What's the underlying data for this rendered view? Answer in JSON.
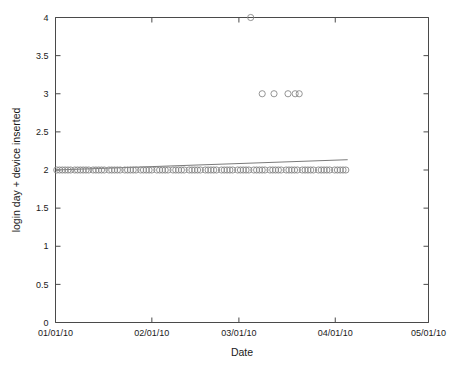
{
  "chart_data": {
    "type": "scatter",
    "title": "",
    "xlabel": "Date",
    "ylabel": "login day + device inserted",
    "xtick_labels": [
      "01/01/10",
      "02/01/10",
      "03/01/10",
      "04/01/10",
      "05/01/10"
    ],
    "xtick_values": [
      0,
      31,
      59,
      90,
      120
    ],
    "xlim": [
      0,
      120
    ],
    "ytick_labels": [
      "0",
      "0.5",
      "1",
      "1.5",
      "2",
      "2.5",
      "3",
      "3.5",
      "4"
    ],
    "ytick_values": [
      0,
      0.5,
      1,
      1.5,
      2,
      2.5,
      3,
      3.5,
      4
    ],
    "ylim": [
      0,
      4
    ],
    "grid": false,
    "legend": null,
    "marker_style": "open-circle",
    "marker_color": "#8a8a8a",
    "trendline_color": "#6b6b6b",
    "series": [
      {
        "name": "login day + device inserted",
        "points": [
          {
            "x": 0.4,
            "y": 2
          },
          {
            "x": 1.3,
            "y": 2
          },
          {
            "x": 2.2,
            "y": 2
          },
          {
            "x": 3.1,
            "y": 2
          },
          {
            "x": 4.0,
            "y": 2
          },
          {
            "x": 4.9,
            "y": 2
          },
          {
            "x": 6.2,
            "y": 2
          },
          {
            "x": 7.1,
            "y": 2
          },
          {
            "x": 8.0,
            "y": 2
          },
          {
            "x": 8.9,
            "y": 2
          },
          {
            "x": 9.8,
            "y": 2
          },
          {
            "x": 10.7,
            "y": 2
          },
          {
            "x": 12.1,
            "y": 2
          },
          {
            "x": 13.0,
            "y": 2
          },
          {
            "x": 13.9,
            "y": 2
          },
          {
            "x": 14.8,
            "y": 2
          },
          {
            "x": 15.7,
            "y": 2
          },
          {
            "x": 17.2,
            "y": 2
          },
          {
            "x": 18.1,
            "y": 2
          },
          {
            "x": 19.0,
            "y": 2
          },
          {
            "x": 19.9,
            "y": 2
          },
          {
            "x": 20.8,
            "y": 2
          },
          {
            "x": 22.3,
            "y": 2
          },
          {
            "x": 23.2,
            "y": 2
          },
          {
            "x": 24.1,
            "y": 2
          },
          {
            "x": 25.0,
            "y": 2
          },
          {
            "x": 25.9,
            "y": 2
          },
          {
            "x": 27.4,
            "y": 2
          },
          {
            "x": 28.3,
            "y": 2
          },
          {
            "x": 29.2,
            "y": 2
          },
          {
            "x": 30.1,
            "y": 2
          },
          {
            "x": 31.0,
            "y": 2
          },
          {
            "x": 32.6,
            "y": 2
          },
          {
            "x": 33.5,
            "y": 2
          },
          {
            "x": 34.4,
            "y": 2
          },
          {
            "x": 35.3,
            "y": 2
          },
          {
            "x": 36.2,
            "y": 2
          },
          {
            "x": 37.8,
            "y": 2
          },
          {
            "x": 38.7,
            "y": 2
          },
          {
            "x": 39.6,
            "y": 2
          },
          {
            "x": 40.5,
            "y": 2
          },
          {
            "x": 41.4,
            "y": 2
          },
          {
            "x": 43.0,
            "y": 2
          },
          {
            "x": 43.9,
            "y": 2
          },
          {
            "x": 44.8,
            "y": 2
          },
          {
            "x": 45.7,
            "y": 2
          },
          {
            "x": 46.6,
            "y": 2
          },
          {
            "x": 48.2,
            "y": 2
          },
          {
            "x": 49.1,
            "y": 2
          },
          {
            "x": 50.0,
            "y": 2
          },
          {
            "x": 50.9,
            "y": 2
          },
          {
            "x": 51.8,
            "y": 2
          },
          {
            "x": 53.4,
            "y": 2
          },
          {
            "x": 54.3,
            "y": 2
          },
          {
            "x": 55.2,
            "y": 2
          },
          {
            "x": 56.1,
            "y": 2
          },
          {
            "x": 57.0,
            "y": 2
          },
          {
            "x": 58.6,
            "y": 2
          },
          {
            "x": 59.5,
            "y": 2
          },
          {
            "x": 60.4,
            "y": 2
          },
          {
            "x": 61.3,
            "y": 2
          },
          {
            "x": 62.2,
            "y": 2
          },
          {
            "x": 63.8,
            "y": 2
          },
          {
            "x": 64.7,
            "y": 2
          },
          {
            "x": 65.6,
            "y": 2
          },
          {
            "x": 66.5,
            "y": 2
          },
          {
            "x": 67.4,
            "y": 2
          },
          {
            "x": 69.0,
            "y": 2
          },
          {
            "x": 69.9,
            "y": 2
          },
          {
            "x": 70.8,
            "y": 2
          },
          {
            "x": 71.7,
            "y": 2
          },
          {
            "x": 72.6,
            "y": 2
          },
          {
            "x": 74.2,
            "y": 2
          },
          {
            "x": 75.1,
            "y": 2
          },
          {
            "x": 76.0,
            "y": 2
          },
          {
            "x": 76.9,
            "y": 2
          },
          {
            "x": 77.8,
            "y": 2
          },
          {
            "x": 79.4,
            "y": 2
          },
          {
            "x": 80.3,
            "y": 2
          },
          {
            "x": 81.2,
            "y": 2
          },
          {
            "x": 82.1,
            "y": 2
          },
          {
            "x": 83.0,
            "y": 2
          },
          {
            "x": 84.6,
            "y": 2
          },
          {
            "x": 85.5,
            "y": 2
          },
          {
            "x": 86.4,
            "y": 2
          },
          {
            "x": 87.3,
            "y": 2
          },
          {
            "x": 88.2,
            "y": 2
          },
          {
            "x": 89.8,
            "y": 2
          },
          {
            "x": 90.7,
            "y": 2
          },
          {
            "x": 91.6,
            "y": 2
          },
          {
            "x": 92.5,
            "y": 2
          },
          {
            "x": 93.4,
            "y": 2
          },
          {
            "x": 66.5,
            "y": 3
          },
          {
            "x": 70.3,
            "y": 3
          },
          {
            "x": 74.8,
            "y": 3
          },
          {
            "x": 77.1,
            "y": 3
          },
          {
            "x": 78.4,
            "y": 3
          },
          {
            "x": 62.8,
            "y": 4
          }
        ]
      }
    ],
    "trendline": {
      "name": "linear fit",
      "x_start": 0,
      "x_end": 94,
      "y_start": 2.0,
      "y_end": 2.135
    }
  }
}
